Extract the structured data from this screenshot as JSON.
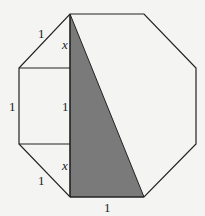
{
  "diagram": {
    "labels": {
      "top_left_edge": "1",
      "left_edge": "1",
      "bottom_left_edge": "1",
      "bottom_edge": "1",
      "upper_x": "x",
      "middle_one": "1",
      "lower_x": "x"
    },
    "colors": {
      "shade": "#7a7a7a",
      "stroke": "#222222",
      "background": "#f4f4f2"
    }
  }
}
